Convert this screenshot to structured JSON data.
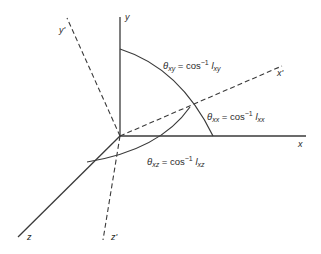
{
  "diagram": {
    "axes": {
      "x": "x",
      "y": "y",
      "z": "z",
      "x_prime": "x'",
      "y_prime": "y'",
      "z_prime": "z'"
    },
    "angles": {
      "theta_xy": {
        "symbol": "θ",
        "subscript": "xy",
        "eq": "= cos",
        "sup": "−1",
        "l": "l",
        "l_sub": "xy"
      },
      "theta_xx": {
        "symbol": "θ",
        "subscript": "xx",
        "eq": "= cos",
        "sup": "−1",
        "l": "l",
        "l_sub": "xx"
      },
      "theta_xz": {
        "symbol": "θ",
        "subscript": "xz",
        "eq": "= cos",
        "sup": "−1",
        "l": "l",
        "l_sub": "xz"
      }
    }
  }
}
